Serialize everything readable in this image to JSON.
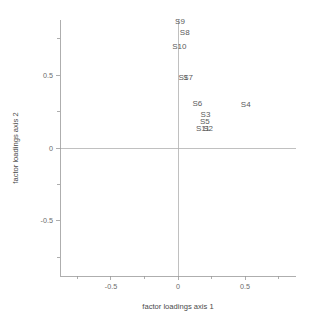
{
  "chart_data": {
    "type": "scatter",
    "title": "",
    "xlabel": "factor loadings axis 1",
    "ylabel": "factor loadings axis 2",
    "xlim": [
      -0.88,
      0.88
    ],
    "ylim": [
      -0.88,
      0.88
    ],
    "grid": false,
    "legend": null,
    "marker_style": "text-label-only",
    "xticks": [
      -0.5,
      0,
      0.5
    ],
    "xticklabels": [
      "-0.5",
      "0",
      "0.5"
    ],
    "yticks": [
      -0.5,
      0,
      0.5
    ],
    "yticklabels": [
      "-0.5",
      "0",
      "0.5"
    ],
    "x_minor_ticks": [
      -0.75,
      -0.25,
      0.25,
      0.75
    ],
    "y_minor_ticks": [
      -0.75,
      -0.25,
      0.25,
      0.75
    ],
    "reference_lines": [
      {
        "axis": "horizontal",
        "value": 0
      },
      {
        "axis": "vertical",
        "value": 0
      }
    ],
    "points": [
      {
        "label": "S9",
        "x": 0.015,
        "y": 0.855
      },
      {
        "label": "S8",
        "x": 0.05,
        "y": 0.775
      },
      {
        "label": "S10",
        "x": 0.01,
        "y": 0.68
      },
      {
        "label": "S1",
        "x": 0.04,
        "y": 0.47
      },
      {
        "label": "S7",
        "x": 0.075,
        "y": 0.465
      },
      {
        "label": "S6",
        "x": 0.145,
        "y": 0.29
      },
      {
        "label": "S4",
        "x": 0.505,
        "y": 0.28
      },
      {
        "label": "S3",
        "x": 0.205,
        "y": 0.215
      },
      {
        "label": "S5",
        "x": 0.2,
        "y": 0.165
      },
      {
        "label": "S11",
        "x": 0.185,
        "y": 0.115
      },
      {
        "label": "S2",
        "x": 0.225,
        "y": 0.115
      }
    ]
  },
  "colors": {
    "background": "#ffffff",
    "axis": "#9a9a9a",
    "zero_line": "#b0b0b0",
    "tick_text": "#6b6b6b",
    "axis_title": "#4a4a4a",
    "point_label": "#5a5a5a"
  }
}
